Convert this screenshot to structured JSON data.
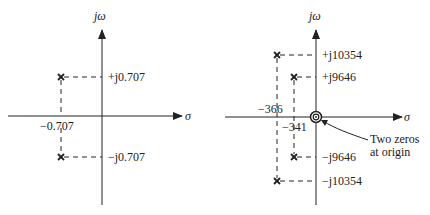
{
  "diagrams": [
    {
      "id": "left",
      "axis_vertical_label": "jω",
      "axis_horizontal_label": "σ",
      "real_label": "−0.707",
      "imag_labels": [
        "+j0.707",
        "−j0.707"
      ],
      "poles": [
        {
          "re": "-0.707",
          "im": "+0.707"
        },
        {
          "re": "-0.707",
          "im": "-0.707"
        }
      ]
    },
    {
      "id": "right",
      "axis_vertical_label": "jω",
      "axis_horizontal_label": "σ",
      "real_labels": [
        "−366",
        "−341"
      ],
      "imag_labels": [
        "+j10354",
        "+j9646",
        "−j9646",
        "−j10354"
      ],
      "poles": [
        {
          "re": "-366",
          "im": "+10354"
        },
        {
          "re": "-341",
          "im": "+9646"
        },
        {
          "re": "-341",
          "im": "-9646"
        },
        {
          "re": "-366",
          "im": "-10354"
        }
      ],
      "zeros_annotation_line1": "Two zeros",
      "zeros_annotation_line2": "at origin"
    }
  ],
  "colors": {
    "ink": "#222222",
    "background": "#ffffff"
  }
}
